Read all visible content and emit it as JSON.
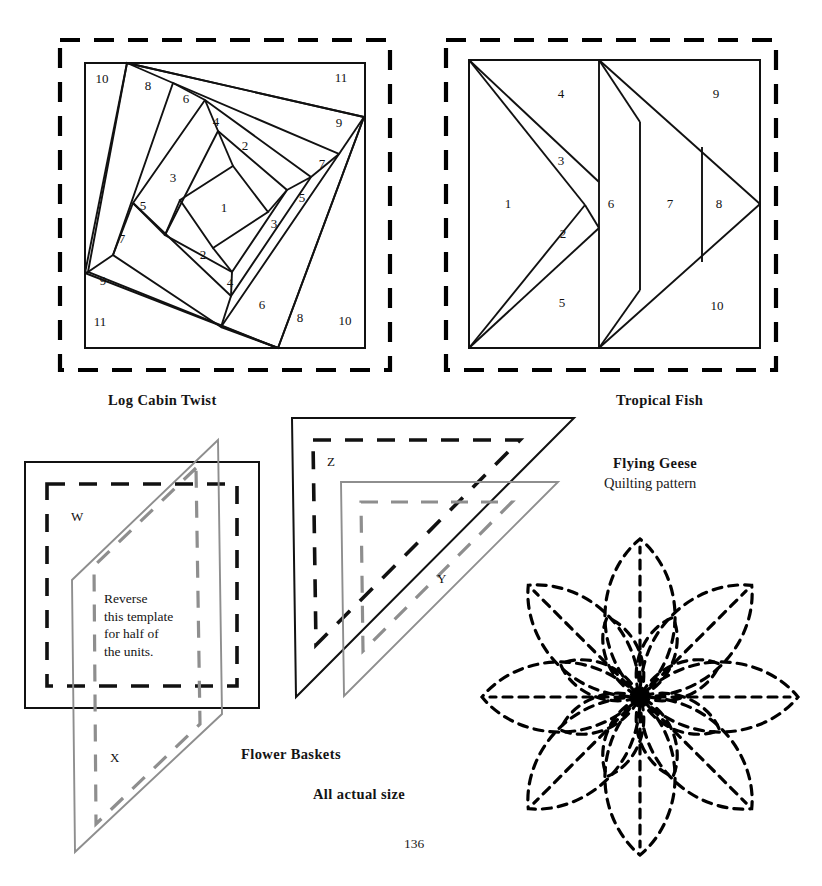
{
  "page": {
    "number": "136",
    "all_actual_size": "All actual size"
  },
  "blocks": [
    {
      "id": "log-cabin-twist",
      "caption": "Log Cabin Twist",
      "type": "foundation-pieced-block",
      "piece_numbers": [
        "1",
        "2",
        "3",
        "4",
        "5",
        "6",
        "7",
        "8",
        "9",
        "10",
        "11",
        "2",
        "3",
        "4",
        "5",
        "6",
        "7",
        "8",
        "9",
        "10",
        "11"
      ]
    },
    {
      "id": "tropical-fish",
      "caption": "Tropical Fish",
      "type": "foundation-pieced-block",
      "piece_numbers": [
        "1",
        "2",
        "3",
        "4",
        "5",
        "6",
        "7",
        "8",
        "9",
        "10"
      ]
    },
    {
      "id": "flower-baskets",
      "caption": "Flower Baskets",
      "type": "templates",
      "template_labels": [
        "W",
        "X",
        "Y",
        "Z"
      ],
      "note": "Reverse\nthis template\nfor half of\nthe units."
    },
    {
      "id": "flying-geese",
      "caption": "Flying Geese",
      "subcaption": "Quilting pattern",
      "type": "quilting-motif"
    }
  ],
  "log_cabin": {
    "labels": [
      {
        "n": "1",
        "x": 224,
        "y": 212
      },
      {
        "n": "2",
        "x": 245,
        "y": 150
      },
      {
        "n": "3",
        "x": 173,
        "y": 182
      },
      {
        "n": "4",
        "x": 216,
        "y": 126
      },
      {
        "n": "5",
        "x": 143,
        "y": 210
      },
      {
        "n": "6",
        "x": 186,
        "y": 103
      },
      {
        "n": "7",
        "x": 122,
        "y": 243
      },
      {
        "n": "8",
        "x": 148,
        "y": 90
      },
      {
        "n": "9",
        "x": 103,
        "y": 285
      },
      {
        "n": "10",
        "x": 102,
        "y": 83
      },
      {
        "n": "11",
        "x": 100,
        "y": 326
      },
      {
        "n": "2",
        "x": 203,
        "y": 259
      },
      {
        "n": "3",
        "x": 274,
        "y": 228
      },
      {
        "n": "4",
        "x": 230,
        "y": 287
      },
      {
        "n": "5",
        "x": 302,
        "y": 202
      },
      {
        "n": "6",
        "x": 262,
        "y": 309
      },
      {
        "n": "7",
        "x": 322,
        "y": 168
      },
      {
        "n": "8",
        "x": 300,
        "y": 322
      },
      {
        "n": "9",
        "x": 339,
        "y": 127
      },
      {
        "n": "10",
        "x": 345,
        "y": 325
      },
      {
        "n": "11",
        "x": 341,
        "y": 82
      }
    ]
  },
  "tropical_fish": {
    "labels": [
      {
        "n": "1",
        "x": 508,
        "y": 208
      },
      {
        "n": "2",
        "x": 563,
        "y": 238
      },
      {
        "n": "3",
        "x": 561,
        "y": 165
      },
      {
        "n": "4",
        "x": 561,
        "y": 98
      },
      {
        "n": "5",
        "x": 562,
        "y": 307
      },
      {
        "n": "6",
        "x": 611,
        "y": 208
      },
      {
        "n": "7",
        "x": 670,
        "y": 208
      },
      {
        "n": "8",
        "x": 719,
        "y": 208
      },
      {
        "n": "9",
        "x": 716,
        "y": 98
      },
      {
        "n": "10",
        "x": 717,
        "y": 310
      }
    ]
  },
  "colors": {
    "ink": "#111111",
    "gray_template": "#8e8e8e",
    "dashed_border": "#000000"
  }
}
